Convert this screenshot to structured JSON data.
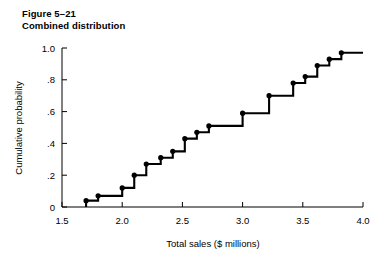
{
  "figure": {
    "number_label": "Figure 5–21",
    "caption": "Combined distribution"
  },
  "chart_data": {
    "type": "line",
    "subtype": "step",
    "title": "Combined distribution",
    "xlabel": "Total sales ($ millions)",
    "ylabel": "Cumulative probability",
    "xlim": [
      1.5,
      4.0
    ],
    "ylim": [
      0,
      1.0
    ],
    "xticks": [
      1.5,
      2.0,
      2.5,
      3.0,
      3.5,
      4.0
    ],
    "xtick_labels": [
      "1.5",
      "2.0",
      "2.5",
      "3.0",
      "3.5",
      "4.0"
    ],
    "yticks": [
      0,
      0.2,
      0.4,
      0.6,
      0.8,
      1.0
    ],
    "ytick_labels": [
      "0",
      ".2",
      ".4",
      ".6",
      ".8",
      "1.0"
    ],
    "grid": false,
    "legend": false,
    "line_color": "#000000",
    "marker": "circle",
    "marker_color": "#000000",
    "x": [
      1.7,
      1.8,
      2.0,
      2.1,
      2.2,
      2.32,
      2.42,
      2.52,
      2.62,
      2.72,
      3.0,
      3.22,
      3.42,
      3.52,
      3.62,
      3.72,
      3.82
    ],
    "y": [
      0.04,
      0.07,
      0.12,
      0.2,
      0.27,
      0.31,
      0.35,
      0.43,
      0.47,
      0.51,
      0.59,
      0.7,
      0.78,
      0.82,
      0.89,
      0.93,
      0.97
    ],
    "step_end_x": 4.0,
    "step_start_x": 1.7,
    "step_start_y": 0.0
  },
  "axes": {
    "x_title": "Total sales ($ millions)",
    "y_title": "Cumulative probability"
  }
}
